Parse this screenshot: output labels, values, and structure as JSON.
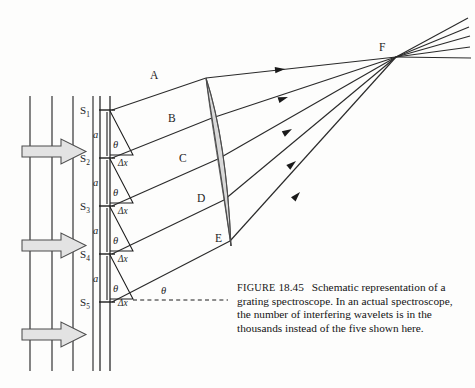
{
  "figure": {
    "title_word": "FIGURE",
    "number": "18.45",
    "caption_lines": [
      "Schematic representation of a",
      "grating spectroscope.  In an actual",
      "spectroscope, the number of interfering",
      "wavelets is in the thousands instead of the",
      "five shown here."
    ],
    "background_color": "#fdfdfc",
    "ink_color": "#1c1c1c",
    "shade_color": "#d9d9d9"
  },
  "labels": {
    "slits": [
      {
        "name": "S",
        "sub": "1"
      },
      {
        "name": "S",
        "sub": "2"
      },
      {
        "name": "S",
        "sub": "3"
      },
      {
        "name": "S",
        "sub": "4"
      },
      {
        "name": "S",
        "sub": "5"
      }
    ],
    "spacing": "a",
    "path_difference": "Δx",
    "angle": "θ",
    "wavelet_points": [
      "A",
      "B",
      "C",
      "D",
      "E"
    ],
    "focus": "F"
  },
  "incoming_wave": {
    "wavefront_count": 4,
    "arrow_count": 3,
    "direction": "right"
  },
  "geometry": {
    "slit_spacing_count": 4,
    "ray_count": 5,
    "focus_point": "F"
  }
}
